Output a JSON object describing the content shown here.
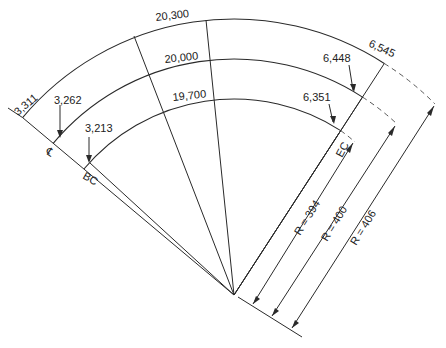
{
  "diagram": {
    "center": {
      "x": 234,
      "y": 295
    },
    "arcs": [
      {
        "name": "outer",
        "radius_label": "R = 406",
        "length_label": "20,300",
        "left_end_label": "3,311",
        "right_end_label": "6,545"
      },
      {
        "name": "centerline",
        "radius_label": "R = 400",
        "length_label": "20,000",
        "left_end_label": "3,262",
        "right_end_label": "6,448"
      },
      {
        "name": "inner",
        "radius_label": "R = 394",
        "length_label": "19,700",
        "left_end_label": "3,213",
        "right_end_label": "6,351"
      }
    ],
    "point_labels": {
      "centerline": "℄",
      "begin_curve": "BC",
      "end_curve": "EC"
    }
  }
}
